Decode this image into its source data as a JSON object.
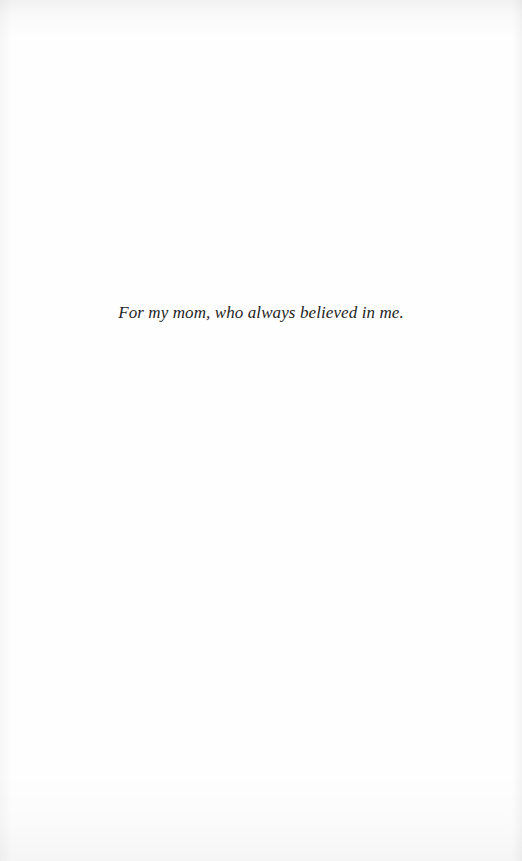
{
  "page": {
    "type": "dedication",
    "background_color": "#fefefe",
    "text_color": "#1e1e1e"
  },
  "dedication": {
    "text": "For my mom, who always believed in me."
  }
}
